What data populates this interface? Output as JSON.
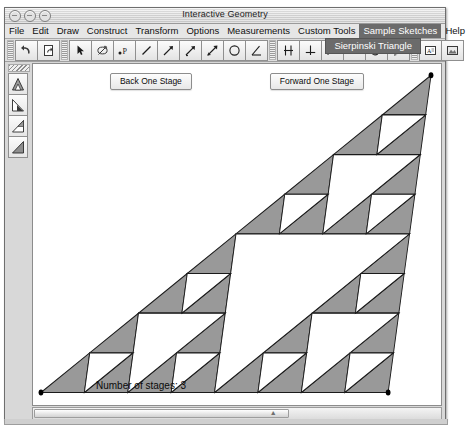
{
  "window": {
    "title": "Interactive Geometry",
    "controls": [
      {
        "name": "close-button"
      },
      {
        "name": "minimize-button"
      },
      {
        "name": "zoom-button"
      }
    ]
  },
  "menubar": {
    "items": [
      {
        "label": "File",
        "selected": false
      },
      {
        "label": "Edit",
        "selected": false
      },
      {
        "label": "Draw",
        "selected": false
      },
      {
        "label": "Construct",
        "selected": false
      },
      {
        "label": "Transform",
        "selected": false
      },
      {
        "label": "Options",
        "selected": false
      },
      {
        "label": "Measurements",
        "selected": false
      },
      {
        "label": "Custom Tools",
        "selected": false
      },
      {
        "label": "Sample Sketches",
        "selected": true
      },
      {
        "label": "Help",
        "selected": false
      }
    ],
    "open_menu": "Sample Sketches",
    "dropdown_items": [
      "Sierpinski Triangle"
    ]
  },
  "toolbar": {
    "icons": [
      "undo-icon",
      "redo-icon",
      "arrow-select-icon",
      "freehand-draw-icon",
      "point-label-icon",
      "segment-icon",
      "ray-icon",
      "vector-icon",
      "line-icon",
      "circle-icon",
      "angle-icon",
      "parallel-icon",
      "perpendicular-icon",
      "midpoint-icon",
      "measure-distance-icon",
      "compass-icon",
      "reflect-icon",
      "text-label-icon",
      "image-icon"
    ]
  },
  "palette": {
    "items": [
      "stage-triangle-full-icon",
      "stage-triangle-left-icon",
      "stage-triangle-right-icon",
      "stage-triangle-solid-icon"
    ]
  },
  "canvas": {
    "back_button": "Back One Stage",
    "forward_button": "Forward One Stage",
    "status": "Number of stages: 3"
  },
  "figure": {
    "name": "sierpinski-triangle",
    "stages": 3,
    "fill_color": "#999999",
    "stroke_color": "#1a1a1a",
    "vertex_color": "#000000",
    "vertices": [
      {
        "label": "bottom-left",
        "x": 8,
        "y": 262
      },
      {
        "label": "bottom-right",
        "x": 356,
        "y": 262
      },
      {
        "label": "apex",
        "x": 399,
        "y": 9
      }
    ]
  },
  "scrollbar": {
    "orientation": "horizontal",
    "thumb_percent": 62
  },
  "colors": {
    "window_bg": "#d8d8d8",
    "canvas_bg": "#ffffff",
    "menu_highlight": "#6b6b6b",
    "figure_fill": "#999999"
  }
}
